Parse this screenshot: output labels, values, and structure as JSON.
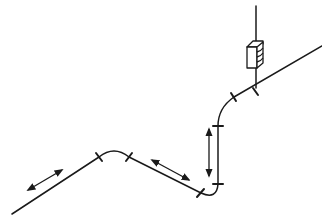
{
  "diagram": {
    "type": "isometric-pipe-routing",
    "description": "Isometric pipe run with bends, joint markers, movement arrows and a wall/ceiling-mounted device",
    "stroke_color": "#1a1a1a",
    "background": "#ffffff",
    "elements": {
      "pipe_segments": [
        "lower-left run",
        "upper bend",
        "middle descending run",
        "bottom bend",
        "vertical riser",
        "upper bend to diagonal",
        "upper right diagonal run"
      ],
      "joint_markers": 6,
      "movement_arrows": [
        "diagonal-left-double-arrow",
        "diagonal-middle-double-arrow",
        "vertical-double-arrow"
      ],
      "device": "box-shaped unit on vertical pipe"
    }
  }
}
